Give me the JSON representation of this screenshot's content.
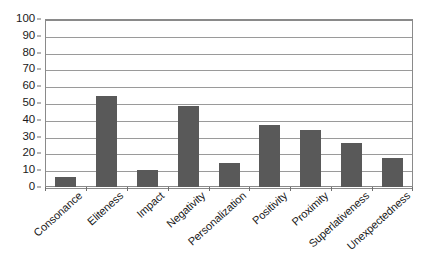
{
  "chart_data": {
    "type": "bar",
    "title": "",
    "subtitle": "",
    "xlabel": "",
    "ylabel": "",
    "categories": [
      "Consonance",
      "Eliteness",
      "Impact",
      "Negativity",
      "Personalization",
      "Positivity",
      "Proximity",
      "Superlativeness",
      "Unexpectedness"
    ],
    "values": [
      6,
      54,
      10,
      48,
      14,
      37,
      34,
      26,
      17
    ],
    "ylim": [
      0,
      100
    ],
    "yticks": [
      0,
      10,
      20,
      30,
      40,
      50,
      60,
      70,
      80,
      90,
      100
    ],
    "ytick_labels": [
      "0",
      "10",
      "20",
      "30",
      "40",
      "50",
      "60",
      "70",
      "80",
      "90",
      "100"
    ],
    "grid": true,
    "grid_axis": "y",
    "legend": false,
    "legend_position": "none",
    "series": [
      {
        "name": "",
        "values": [
          6,
          54,
          10,
          48,
          14,
          37,
          34,
          26,
          17
        ]
      }
    ],
    "annotations": []
  },
  "style": {
    "bar_color": "#595959",
    "gridline_color": "#9a9a9a",
    "frame_color": "#8a8a8a",
    "background": "#ffffff",
    "text_color": "#1a1a1a",
    "xtick_rotation_deg": -42
  }
}
